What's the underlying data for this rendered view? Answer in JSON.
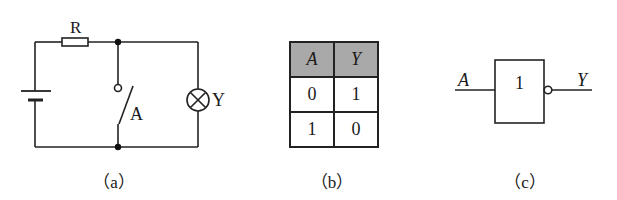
{
  "figure_a": {
    "caption": "（a）",
    "resistor_label": "R",
    "switch_label": "A",
    "lamp_label": "Y",
    "components": [
      "battery",
      "resistor",
      "switch",
      "lamp"
    ]
  },
  "figure_b": {
    "caption": "（b）",
    "headers": [
      "A",
      "Y"
    ],
    "rows": [
      [
        "0",
        "1"
      ],
      [
        "1",
        "0"
      ]
    ]
  },
  "figure_c": {
    "caption": "（c）",
    "input_label": "A",
    "output_label": "Y",
    "gate_symbol": "1",
    "gate_type": "NOT"
  }
}
